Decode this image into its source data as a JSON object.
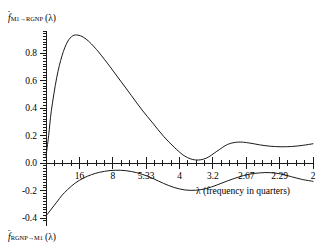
{
  "chart_data": {
    "type": "line",
    "title": "",
    "subtitle": "",
    "xlabel": "λ (frequency in quarters)",
    "ylabel": "",
    "grid": false,
    "legend_position": "none",
    "xlim": [
      0,
      1
    ],
    "ylim": [
      -0.42,
      0.96
    ],
    "x_tick_labels": [
      "16",
      "8",
      "5.33",
      "4",
      "3.2",
      "2.67",
      "2.29",
      "2"
    ],
    "x_tick_positions": [
      0.125,
      0.25,
      0.375,
      0.5,
      0.625,
      0.75,
      0.875,
      1.0
    ],
    "x_tick_note": "period in quarters, decreasing left to right; minor ticks subdivide each major interval into four",
    "y_tick_labels": [
      "0.8",
      "0.6",
      "0.4",
      "0.2",
      "0.0",
      "-0.2",
      "-0.4"
    ],
    "y_tick_values": [
      0.8,
      0.6,
      0.4,
      0.2,
      0.0,
      -0.2,
      -0.4
    ],
    "series": [
      {
        "name": "f_M1->RGNP(lambda)",
        "label_plain": "f̂ M1→RGNP (λ)",
        "color": "#1a1a1a",
        "x": [
          0.0,
          0.01,
          0.02,
          0.04,
          0.06,
          0.08,
          0.1,
          0.12,
          0.14,
          0.16,
          0.18,
          0.2,
          0.24,
          0.28,
          0.32,
          0.36,
          0.4,
          0.44,
          0.48,
          0.52,
          0.56,
          0.6,
          0.64,
          0.68,
          0.72,
          0.76,
          0.8,
          0.84,
          0.88,
          0.92,
          0.96,
          1.0
        ],
        "values": [
          0.05,
          0.2,
          0.38,
          0.62,
          0.78,
          0.88,
          0.925,
          0.93,
          0.915,
          0.885,
          0.845,
          0.8,
          0.7,
          0.595,
          0.49,
          0.385,
          0.29,
          0.195,
          0.115,
          0.05,
          0.022,
          0.035,
          0.085,
          0.135,
          0.152,
          0.146,
          0.132,
          0.122,
          0.118,
          0.12,
          0.128,
          0.14
        ]
      },
      {
        "name": "f_RGNP->M1(lambda)",
        "label_plain": "f̂ RGNP→M1 (λ)",
        "color": "#1a1a1a",
        "x": [
          0.0,
          0.02,
          0.04,
          0.06,
          0.08,
          0.11,
          0.14,
          0.17,
          0.2,
          0.24,
          0.28,
          0.32,
          0.36,
          0.4,
          0.44,
          0.48,
          0.52,
          0.56,
          0.6,
          0.64,
          0.68,
          0.72,
          0.76,
          0.8,
          0.84,
          0.88,
          0.92,
          0.96,
          1.0
        ],
        "values": [
          -0.385,
          -0.335,
          -0.285,
          -0.235,
          -0.195,
          -0.145,
          -0.11,
          -0.085,
          -0.068,
          -0.055,
          -0.053,
          -0.062,
          -0.082,
          -0.112,
          -0.148,
          -0.178,
          -0.196,
          -0.198,
          -0.186,
          -0.16,
          -0.13,
          -0.103,
          -0.082,
          -0.072,
          -0.07,
          -0.08,
          -0.1,
          -0.12,
          -0.133
        ]
      }
    ]
  },
  "labels": {
    "top_series_label": {
      "fhat": "f",
      "sub": "M1→RGNP",
      "arg": "(λ)"
    },
    "bottom_series_label": {
      "fhat": "f",
      "sub": "RGNP→M1",
      "arg": "(λ)"
    },
    "x_axis_title": "λ (frequency in quarters)"
  },
  "colors": {
    "curve": "#1a1a1a",
    "axis": "#1a1a1a",
    "background": "#ffffff"
  }
}
